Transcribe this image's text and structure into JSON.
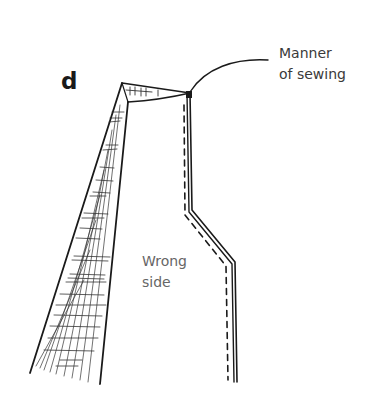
{
  "figure": {
    "letter": "d",
    "callout": {
      "line1": "Manner",
      "line2": "of sewing"
    },
    "region_label": {
      "line1": "Wrong",
      "line2": "side"
    }
  },
  "colors": {
    "ink": "#1a1a1a",
    "label_text": "#3a3a3a",
    "region_text": "#666666",
    "background": "#ffffff"
  }
}
